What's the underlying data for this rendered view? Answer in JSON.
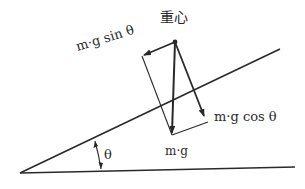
{
  "diagram": {
    "labels": {
      "center_of_gravity": "重心",
      "parallel_component": "m·g sin θ",
      "perpendicular_component": "m·g cos θ",
      "weight": "m·g",
      "angle": "θ"
    },
    "colors": {
      "line": "#2a2a2a",
      "background": "#ffffff"
    },
    "geometry": {
      "slope_vertex": [
        20,
        173
      ],
      "slope_end": [
        280,
        49
      ],
      "ground_end": [
        295,
        167
      ],
      "center_of_gravity": [
        175,
        42
      ],
      "weight_tip": [
        172,
        135
      ],
      "sin_tip": [
        142,
        56
      ],
      "cos_tip": [
        206,
        120
      ]
    }
  }
}
